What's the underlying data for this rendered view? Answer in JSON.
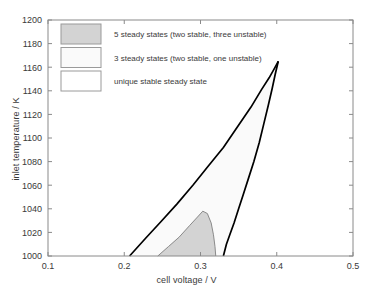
{
  "chart_data": {
    "type": "area",
    "title": "",
    "xlabel": "cell voltage / V",
    "ylabel": "inlet temperature / K",
    "xlim": [
      0.1,
      0.5
    ],
    "ylim": [
      1000,
      1200
    ],
    "xticks": [
      "0.1",
      "0.2",
      "0.3",
      "0.4",
      "0.5"
    ],
    "xtick_values": [
      0.1,
      0.2,
      0.3,
      0.4,
      0.5
    ],
    "yticks": [
      "1000",
      "1020",
      "1040",
      "1060",
      "1080",
      "1100",
      "1120",
      "1140",
      "1160",
      "1180",
      "1200"
    ],
    "ytick_values": [
      1000,
      1020,
      1040,
      1060,
      1080,
      1100,
      1120,
      1140,
      1160,
      1180,
      1200
    ],
    "grid": false,
    "legend_position": "upper-left",
    "regions": [
      {
        "name": "five-steady-states",
        "label": "5 steady states (two stable, three unstable)",
        "fill": "#d3d3d3",
        "boundary": [
          [
            0.244,
            1000
          ],
          [
            0.258,
            1008
          ],
          [
            0.272,
            1016
          ],
          [
            0.286,
            1026
          ],
          [
            0.296,
            1033
          ],
          [
            0.303,
            1038
          ],
          [
            0.309,
            1036
          ],
          [
            0.314,
            1028
          ],
          [
            0.317,
            1018
          ],
          [
            0.319,
            1008
          ],
          [
            0.32,
            1000
          ]
        ]
      },
      {
        "name": "three-steady-states",
        "label": "3 steady states (two stable, one unstable)",
        "fill": "#fafafa",
        "boundary": [
          [
            0.207,
            1000
          ],
          [
            0.248,
            1029
          ],
          [
            0.29,
            1060
          ],
          [
            0.33,
            1092
          ],
          [
            0.366,
            1126
          ],
          [
            0.39,
            1151
          ],
          [
            0.402,
            1165
          ],
          [
            0.394,
            1142
          ],
          [
            0.383,
            1112
          ],
          [
            0.37,
            1080
          ],
          [
            0.356,
            1052
          ],
          [
            0.344,
            1028
          ],
          [
            0.334,
            1010
          ],
          [
            0.33,
            1000
          ]
        ]
      },
      {
        "name": "unique-stable-steady-state",
        "label": "unique stable steady state",
        "fill": "#ffffff",
        "boundary": []
      }
    ],
    "curves": [
      {
        "name": "left-fold-curve",
        "color": "#000000",
        "points": [
          [
            0.207,
            1000
          ],
          [
            0.228,
            1015
          ],
          [
            0.248,
            1029
          ],
          [
            0.269,
            1044
          ],
          [
            0.29,
            1060
          ],
          [
            0.31,
            1076
          ],
          [
            0.33,
            1092
          ],
          [
            0.349,
            1110
          ],
          [
            0.366,
            1126
          ],
          [
            0.38,
            1141
          ],
          [
            0.39,
            1151
          ],
          [
            0.397,
            1159
          ],
          [
            0.402,
            1165
          ]
        ]
      },
      {
        "name": "right-fold-curve",
        "color": "#000000",
        "points": [
          [
            0.33,
            1000
          ],
          [
            0.334,
            1010
          ],
          [
            0.339,
            1019
          ],
          [
            0.344,
            1028
          ],
          [
            0.35,
            1040
          ],
          [
            0.356,
            1052
          ],
          [
            0.363,
            1066
          ],
          [
            0.37,
            1080
          ],
          [
            0.377,
            1096
          ],
          [
            0.383,
            1112
          ],
          [
            0.389,
            1128
          ],
          [
            0.394,
            1142
          ],
          [
            0.398,
            1154
          ],
          [
            0.402,
            1165
          ]
        ]
      },
      {
        "name": "inner-region-boundary",
        "color": "#7f7f7f",
        "points": [
          [
            0.244,
            1000
          ],
          [
            0.258,
            1008
          ],
          [
            0.272,
            1016
          ],
          [
            0.286,
            1026
          ],
          [
            0.296,
            1033
          ],
          [
            0.303,
            1038
          ],
          [
            0.309,
            1036
          ],
          [
            0.314,
            1028
          ],
          [
            0.317,
            1018
          ],
          [
            0.319,
            1008
          ],
          [
            0.32,
            1000
          ]
        ]
      }
    ],
    "legend": [
      {
        "swatch_color": "#d3d3d3",
        "label": "5 steady states (two stable, three unstable)"
      },
      {
        "swatch_color": "#fafafa",
        "label": "3 steady states (two stable, one unstable)"
      },
      {
        "swatch_color": "#ffffff",
        "label": "unique stable steady state"
      }
    ]
  }
}
